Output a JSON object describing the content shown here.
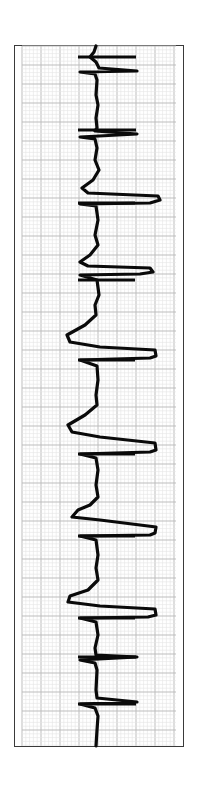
{
  "figure": {
    "type": "ecg-strip",
    "orientation": "vertical",
    "colors": {
      "background": "#ffffff",
      "border": "#3a3a3a",
      "grid_minor": "#e4e4e4",
      "grid_major": "#bdbdbd",
      "trace": "#0a0a0a"
    },
    "grid": {
      "left": 22,
      "right": 176,
      "top": 46,
      "bottom": 746,
      "minor_step": 3.8,
      "major_step": 19
    },
    "trace_points": [
      [
        96,
        46
      ],
      [
        94,
        52
      ],
      [
        90,
        57
      ],
      [
        96,
        62
      ],
      [
        99,
        68
      ],
      [
        137,
        71
      ],
      [
        80,
        72
      ],
      [
        95,
        74
      ],
      [
        97,
        80
      ],
      [
        96,
        95
      ],
      [
        98,
        105
      ],
      [
        96,
        118
      ],
      [
        97,
        128
      ],
      [
        95,
        131
      ],
      [
        137,
        134
      ],
      [
        80,
        137
      ],
      [
        95,
        139
      ],
      [
        97,
        148
      ],
      [
        95,
        160
      ],
      [
        99,
        170
      ],
      [
        93,
        180
      ],
      [
        82,
        188
      ],
      [
        88,
        193
      ],
      [
        158,
        196
      ],
      [
        160,
        200
      ],
      [
        150,
        203
      ],
      [
        80,
        204
      ],
      [
        96,
        206
      ],
      [
        98,
        220
      ],
      [
        95,
        235
      ],
      [
        98,
        245
      ],
      [
        90,
        255
      ],
      [
        80,
        262
      ],
      [
        88,
        266
      ],
      [
        150,
        268
      ],
      [
        153,
        272
      ],
      [
        140,
        274
      ],
      [
        80,
        275
      ],
      [
        97,
        280
      ],
      [
        99,
        295
      ],
      [
        95,
        305
      ],
      [
        96,
        315
      ],
      [
        85,
        325
      ],
      [
        67,
        335
      ],
      [
        70,
        342
      ],
      [
        100,
        347
      ],
      [
        155,
        350
      ],
      [
        156,
        356
      ],
      [
        150,
        358
      ],
      [
        80,
        360
      ],
      [
        97,
        366
      ],
      [
        98,
        380
      ],
      [
        96,
        395
      ],
      [
        97,
        405
      ],
      [
        85,
        415
      ],
      [
        68,
        425
      ],
      [
        72,
        432
      ],
      [
        100,
        437
      ],
      [
        155,
        443
      ],
      [
        156,
        450
      ],
      [
        150,
        452
      ],
      [
        80,
        454
      ],
      [
        96,
        458
      ],
      [
        98,
        470
      ],
      [
        96,
        485
      ],
      [
        98,
        497
      ],
      [
        90,
        505
      ],
      [
        78,
        510
      ],
      [
        72,
        517
      ],
      [
        100,
        520
      ],
      [
        156,
        527
      ],
      [
        155,
        533
      ],
      [
        150,
        535
      ],
      [
        80,
        536
      ],
      [
        96,
        540
      ],
      [
        98,
        555
      ],
      [
        96,
        568
      ],
      [
        98,
        580
      ],
      [
        88,
        590
      ],
      [
        70,
        596
      ],
      [
        68,
        602
      ],
      [
        100,
        606
      ],
      [
        155,
        609
      ],
      [
        156,
        615
      ],
      [
        148,
        617
      ],
      [
        80,
        618
      ],
      [
        96,
        622
      ],
      [
        98,
        635
      ],
      [
        95,
        648
      ],
      [
        96,
        655
      ],
      [
        137,
        657
      ],
      [
        80,
        660
      ],
      [
        95,
        663
      ],
      [
        97,
        670
      ],
      [
        96,
        690
      ],
      [
        97,
        698
      ],
      [
        137,
        702
      ],
      [
        80,
        704
      ],
      [
        95,
        708
      ],
      [
        98,
        716
      ],
      [
        97,
        730
      ],
      [
        96,
        746
      ]
    ],
    "horizontal_marks": [
      {
        "y": 57,
        "x1": 78,
        "x2": 136
      },
      {
        "y": 130,
        "x1": 78,
        "x2": 136
      },
      {
        "y": 203,
        "x1": 78,
        "x2": 135
      },
      {
        "y": 280,
        "x1": 78,
        "x2": 135
      },
      {
        "y": 360,
        "x1": 78,
        "x2": 135
      },
      {
        "y": 454,
        "x1": 78,
        "x2": 135
      },
      {
        "y": 536,
        "x1": 78,
        "x2": 135
      },
      {
        "y": 618,
        "x1": 78,
        "x2": 135
      },
      {
        "y": 657,
        "x1": 78,
        "x2": 136
      },
      {
        "y": 704,
        "x1": 78,
        "x2": 136
      }
    ]
  }
}
